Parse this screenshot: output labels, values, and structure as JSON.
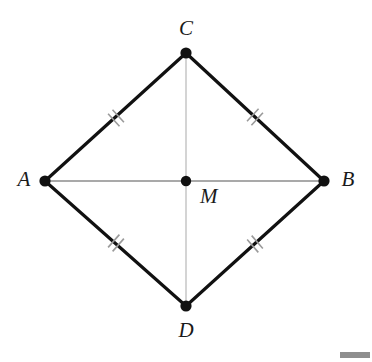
{
  "figure": {
    "type": "geometry-diagram",
    "shape": "rhombus",
    "width": 372,
    "height": 362,
    "background_color": "#ffffff",
    "stroke_colors": {
      "outline": "#111111",
      "diagonal": "#8c8c8c",
      "diagonal_vertical": "#c2c2c2",
      "tick": "#9a9a9a",
      "label": "#1a1a1a",
      "vertex_dot": "#111111"
    },
    "stroke_widths": {
      "outline": 3.2,
      "diagonal_horizontal": 1.4,
      "diagonal_vertical": 1.4,
      "tick": 1.6
    },
    "vertices": [
      {
        "id": "C",
        "label": "C",
        "x": 186,
        "y": 53,
        "label_x": 186,
        "label_y": 30,
        "label_anchor": "middle",
        "dot_r": 5.6
      },
      {
        "id": "A",
        "label": "A",
        "x": 45,
        "y": 181,
        "label_x": 24,
        "label_y": 181,
        "label_anchor": "middle",
        "dot_r": 5.6
      },
      {
        "id": "B",
        "label": "B",
        "x": 324,
        "y": 181,
        "label_x": 348,
        "label_y": 181,
        "label_anchor": "middle",
        "dot_r": 5.6
      },
      {
        "id": "D",
        "label": "D",
        "x": 186,
        "y": 306,
        "label_x": 186,
        "label_y": 332,
        "label_anchor": "middle",
        "dot_r": 5.6
      }
    ],
    "center_point": {
      "id": "M",
      "label": "M",
      "x": 186,
      "y": 181,
      "label_x": 200,
      "label_y": 198,
      "label_anchor": "start",
      "dot_r": 5.2
    },
    "edges": [
      {
        "id": "AC",
        "from": "A",
        "to": "C",
        "x1": 45,
        "y1": 181,
        "x2": 186,
        "y2": 53,
        "kind": "outline",
        "ticks": 2
      },
      {
        "id": "CB",
        "from": "C",
        "to": "B",
        "x1": 186,
        "y1": 53,
        "x2": 324,
        "y2": 181,
        "kind": "outline",
        "ticks": 2
      },
      {
        "id": "AD",
        "from": "A",
        "to": "D",
        "x1": 45,
        "y1": 181,
        "x2": 186,
        "y2": 306,
        "kind": "outline",
        "ticks": 2
      },
      {
        "id": "DB",
        "from": "D",
        "to": "B",
        "x1": 186,
        "y1": 306,
        "x2": 324,
        "y2": 181,
        "kind": "outline",
        "ticks": 2
      }
    ],
    "diagonals": [
      {
        "id": "AB",
        "from": "A",
        "to": "B",
        "x1": 45,
        "y1": 181,
        "x2": 324,
        "y2": 181,
        "kind": "diagonal-horizontal"
      },
      {
        "id": "CD",
        "from": "C",
        "to": "D",
        "x1": 186,
        "y1": 53,
        "x2": 186,
        "y2": 306,
        "kind": "diagonal-vertical"
      }
    ],
    "tick_marks": [
      {
        "edge": "AC",
        "cx": 116,
        "cy": 118,
        "angle_deg": -42.2,
        "count": 2,
        "spacing": 6,
        "length": 17
      },
      {
        "edge": "CB",
        "cx": 255,
        "cy": 117,
        "angle_deg": 42.8,
        "count": 2,
        "spacing": 6,
        "length": 17
      },
      {
        "edge": "AD",
        "cx": 116,
        "cy": 243,
        "angle_deg": 41.5,
        "count": 2,
        "spacing": 6,
        "length": 17
      },
      {
        "edge": "DB",
        "cx": 255,
        "cy": 244,
        "angle_deg": -41.0,
        "count": 2,
        "spacing": 6,
        "length": 17
      }
    ],
    "corner_artifact": {
      "present": true,
      "color": "#8e8e8e"
    }
  }
}
